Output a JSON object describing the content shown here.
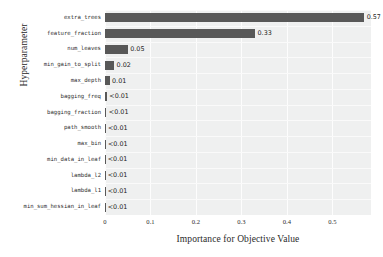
{
  "chart_data": {
    "type": "bar",
    "orientation": "horizontal",
    "title": "",
    "xlabel": "Importance for Objective Value",
    "ylabel": "Hyperparameter",
    "xlim": [
      0,
      0.585
    ],
    "ylim": [
      0,
      13
    ],
    "grid": true,
    "legend": null,
    "xticks": [
      "0",
      "0.1",
      "0.2",
      "0.3",
      "0.4",
      "0.5"
    ],
    "xtick_values": [
      0,
      0.1,
      0.2,
      0.3,
      0.4,
      0.5
    ],
    "categories": [
      "extra_trees",
      "feature_fraction",
      "num_leaves",
      "min_gain_to_split",
      "max_depth",
      "bagging_freq",
      "bagging_fraction",
      "path_smooth",
      "max_bin",
      "min_data_in_leaf",
      "lambda_l2",
      "lambda_l1",
      "min_sum_hessian_in_leaf"
    ],
    "values": [
      0.57,
      0.33,
      0.05,
      0.02,
      0.01,
      0.004,
      0.003,
      0.001,
      0.001,
      0.0005,
      0.0005,
      0.0005,
      0.0005
    ],
    "value_labels": [
      "0.57",
      "0.33",
      "0.05",
      "0.02",
      "0.01",
      "<0.01",
      "<0.01",
      "<0.01",
      "<0.01",
      "<0.01",
      "<0.01",
      "<0.01",
      "<0.01"
    ],
    "bar_color": "#585858",
    "plot_background": "#eff0f0",
    "grid_color": "#fdfdfd"
  }
}
